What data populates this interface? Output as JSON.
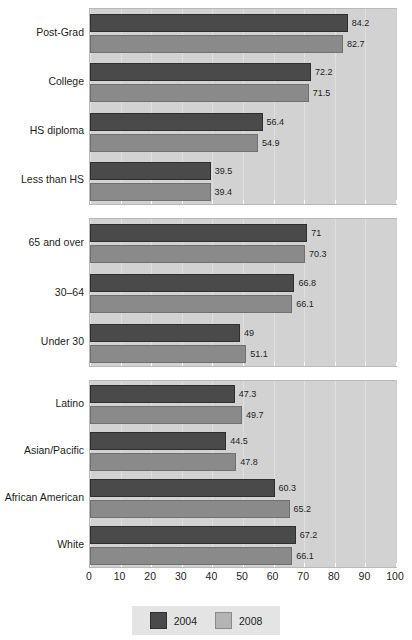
{
  "chart_data": {
    "type": "bar",
    "orientation": "horizontal",
    "title": "",
    "subtitle": "",
    "xlabel": "",
    "ylabel": "",
    "xlim": [
      0,
      100
    ],
    "xticks": [
      0,
      10,
      20,
      30,
      40,
      50,
      60,
      70,
      80,
      90,
      100
    ],
    "grid": true,
    "legend_position": "bottom",
    "series": [
      {
        "name": "2004",
        "color": "#4a4a4a"
      },
      {
        "name": "2008",
        "color": "#8a8a8a"
      }
    ],
    "panels": [
      {
        "name": "education",
        "categories": [
          "Post-Grad",
          "College",
          "HS diploma",
          "Less than HS"
        ],
        "series": [
          {
            "name": "2004",
            "values": [
              84.2,
              72.2,
              56.4,
              39.5
            ]
          },
          {
            "name": "2008",
            "values": [
              82.7,
              71.5,
              54.9,
              39.4
            ]
          }
        ]
      },
      {
        "name": "age",
        "categories": [
          "65 and over",
          "30–64",
          "Under 30"
        ],
        "series": [
          {
            "name": "2004",
            "values": [
              71,
              66.8,
              49
            ]
          },
          {
            "name": "2008",
            "values": [
              70.3,
              66.1,
              51.1
            ]
          }
        ]
      },
      {
        "name": "race-ethnicity",
        "categories": [
          "Latino",
          "Asian/Pacific",
          "African American",
          "White"
        ],
        "series": [
          {
            "name": "2004",
            "values": [
              47.3,
              44.5,
              60.3,
              67.2
            ]
          },
          {
            "name": "2008",
            "values": [
              49.7,
              47.8,
              65.2,
              66.1
            ]
          }
        ]
      }
    ],
    "value_labels": {
      "education": {
        "2004": [
          "84.2",
          "72.2",
          "56.4",
          "39.5"
        ],
        "2008": [
          "82.7",
          "71.5",
          "54.9",
          "39.4"
        ]
      },
      "age": {
        "2004": [
          "71",
          "66.8",
          "49"
        ],
        "2008": [
          "70.3",
          "66.1",
          "51.1"
        ]
      },
      "race-ethnicity": {
        "2004": [
          "47.3",
          "44.5",
          "60.3",
          "67.2"
        ],
        "2008": [
          "49.7",
          "47.8",
          "65.2",
          "66.1"
        ]
      }
    },
    "axis_tick_labels": [
      "0",
      "10",
      "20",
      "30",
      "40",
      "50",
      "60",
      "70",
      "80",
      "90",
      "100"
    ],
    "legend": {
      "items": [
        {
          "label": "2004",
          "color": "#4a4a4a"
        },
        {
          "label": "2008",
          "color": "#b4b4b4"
        }
      ]
    },
    "colors": {
      "series_2004": "#4a4a4a",
      "series_2008": "#8a8a8a",
      "plot_background": "#d2d2d2",
      "page_background": "#ffffff",
      "legend_background": "#e4e4e4",
      "text": "#1d1d1d"
    }
  }
}
